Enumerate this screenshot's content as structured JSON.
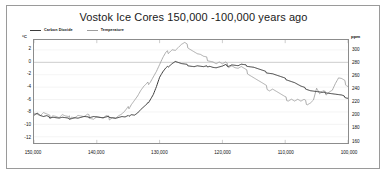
{
  "chart_data": {
    "type": "line",
    "title": "Vostok Ice Cores 150,000 -100,000 years ago",
    "xlabel": "",
    "ylabel": "°C",
    "ylabel_right": "ppm",
    "grid": true,
    "legend_position": "top-left",
    "xlim": [
      150000,
      100000
    ],
    "ylim": [
      -13,
      3.6
    ],
    "ylim_right": [
      156.4,
      316
    ],
    "x_ticks": [
      "150,000",
      "140,000",
      "130,000",
      "120,000",
      "110,000",
      "100,000"
    ],
    "x_tick_values": [
      150000,
      140000,
      130000,
      120000,
      110000,
      100000
    ],
    "y_ticks_left": [
      "2",
      "0",
      "-2",
      "-4",
      "-6",
      "-8",
      "-10",
      "-12"
    ],
    "y_tick_values_left": [
      2,
      0,
      -2,
      -4,
      -6,
      -8,
      -10,
      -12
    ],
    "y_ticks_right": [
      "300",
      "280",
      "260",
      "240",
      "220",
      "200",
      "180",
      "160"
    ],
    "y_tick_values_right": [
      300,
      280,
      260,
      240,
      220,
      200,
      180,
      160
    ],
    "series": [
      {
        "name": "Carbon Dioxide",
        "axis": "right",
        "unit": "ppm",
        "color": "#3c3c3c",
        "x": [
          150000,
          149500,
          149000,
          148500,
          148000,
          147500,
          147000,
          146500,
          146000,
          145500,
          145000,
          144500,
          144000,
          143500,
          143000,
          142500,
          142000,
          141500,
          141000,
          140500,
          140000,
          139500,
          139000,
          138500,
          138000,
          137500,
          137000,
          136500,
          136000,
          135500,
          135000,
          134500,
          134000,
          133500,
          133000,
          132500,
          132000,
          131500,
          131000,
          130500,
          130000,
          129500,
          129000,
          128500,
          128000,
          127500,
          127000,
          126500,
          126000,
          125500,
          125000,
          124500,
          124000,
          123500,
          123000,
          122500,
          122000,
          121500,
          121000,
          120500,
          120000,
          119500,
          119000,
          118500,
          118000,
          117500,
          117000,
          116500,
          116000,
          115500,
          115000,
          114500,
          114000,
          113500,
          113000,
          112500,
          112000,
          111500,
          111000,
          110500,
          110000,
          109500,
          109000,
          108500,
          108000,
          107500,
          107000,
          106500,
          106000,
          105500,
          105000,
          104500,
          104000,
          103500,
          103000,
          102500,
          102000,
          101500,
          101000,
          100500,
          100000
        ],
        "values": [
          200,
          203,
          199,
          197,
          198,
          196,
          197,
          196,
          195,
          196,
          195,
          194,
          195,
          196,
          195,
          196,
          197,
          196,
          197,
          198,
          197,
          196,
          195,
          196,
          197,
          196,
          195,
          196,
          197,
          196,
          198,
          201,
          200,
          203,
          208,
          212,
          216,
          224,
          232,
          244,
          258,
          266,
          272,
          276,
          280,
          283,
          281,
          279,
          278,
          277,
          276,
          275,
          276,
          275,
          274,
          275,
          276,
          274,
          273,
          274,
          275,
          277,
          276,
          278,
          277,
          276,
          278,
          277,
          276,
          275,
          274,
          272,
          270,
          268,
          266,
          265,
          264,
          262,
          260,
          258,
          256,
          254,
          252,
          250,
          247,
          244,
          242,
          240,
          238,
          237,
          236,
          235,
          234,
          235,
          234,
          233,
          232,
          231,
          230,
          228,
          226
        ]
      },
      {
        "name": "Temperature",
        "axis": "left",
        "unit": "°C",
        "color": "#9e9e9e",
        "x": [
          150000,
          149500,
          149000,
          148500,
          148000,
          147500,
          147000,
          146500,
          146000,
          145500,
          145000,
          144500,
          144000,
          143500,
          143000,
          142500,
          142000,
          141500,
          141000,
          140500,
          140000,
          139500,
          139000,
          138500,
          138000,
          137500,
          137000,
          136500,
          136000,
          135500,
          135000,
          134500,
          134000,
          133500,
          133000,
          132500,
          132000,
          131500,
          131000,
          130500,
          130000,
          129500,
          129000,
          128500,
          128000,
          127500,
          127000,
          126500,
          126000,
          125500,
          125000,
          124500,
          124000,
          123500,
          123000,
          122500,
          122000,
          121500,
          121000,
          120500,
          120000,
          119500,
          119000,
          118500,
          118000,
          117500,
          117000,
          116500,
          116000,
          115500,
          115000,
          114500,
          114000,
          113500,
          113000,
          112500,
          112000,
          111500,
          111000,
          110500,
          110000,
          109500,
          109000,
          108500,
          108000,
          107500,
          107000,
          106500,
          106000,
          105500,
          105000,
          104500,
          104000,
          103500,
          103000,
          102500,
          102000,
          101500,
          101000,
          100500,
          100000
        ],
        "values": [
          -8.0,
          -8.3,
          -8.6,
          -8.2,
          -8.5,
          -8.8,
          -8.4,
          -8.6,
          -8.9,
          -8.5,
          -8.8,
          -9.0,
          -8.6,
          -8.8,
          -8.5,
          -8.7,
          -8.9,
          -8.6,
          -8.8,
          -9.0,
          -8.7,
          -8.9,
          -9.1,
          -8.8,
          -9.0,
          -8.7,
          -8.9,
          -8.6,
          -8.4,
          -8.0,
          -7.4,
          -6.6,
          -6.0,
          -5.4,
          -4.6,
          -4.0,
          -3.6,
          -3.0,
          -2.2,
          -1.4,
          -0.4,
          0.6,
          1.4,
          1.8,
          2.2,
          2.0,
          2.4,
          2.8,
          3.0,
          2.6,
          2.2,
          1.8,
          1.4,
          1.2,
          0.8,
          0.6,
          0.4,
          0.2,
          -0.2,
          0.0,
          -0.4,
          -0.2,
          -0.6,
          -0.4,
          -0.8,
          -1.0,
          -0.8,
          -1.2,
          -1.6,
          -2.0,
          -2.4,
          -2.8,
          -3.2,
          -3.6,
          -4.0,
          -4.4,
          -4.2,
          -4.6,
          -5.0,
          -5.4,
          -5.8,
          -6.0,
          -5.8,
          -6.2,
          -6.0,
          -6.4,
          -6.2,
          -6.6,
          -6.4,
          -6.0,
          -4.2,
          -5.2,
          -4.8,
          -5.0,
          -4.6,
          -4.4,
          -3.4,
          -2.6,
          -2.8,
          -3.2,
          -3.8
        ]
      }
    ]
  },
  "axes": {
    "left_unit": "°C",
    "right_unit": "ppm"
  }
}
